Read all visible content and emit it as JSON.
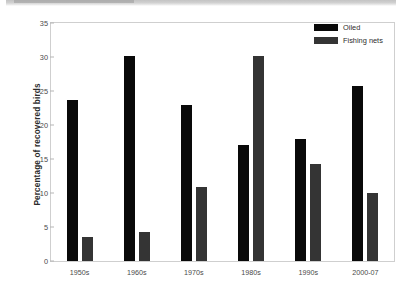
{
  "chart_data": {
    "type": "bar",
    "title": "",
    "xlabel": "",
    "ylabel": "Percentage of recovered birds",
    "categories": [
      "1950s",
      "1960s",
      "1970s",
      "1980s",
      "1990s",
      "2000-07"
    ],
    "series": [
      {
        "name": "Oiled",
        "color": "#090909",
        "values": [
          23.7,
          30.1,
          23.0,
          17.0,
          17.9,
          25.7
        ]
      },
      {
        "name": "Fishing nets",
        "color": "#343434",
        "values": [
          3.5,
          4.2,
          10.9,
          30.2,
          14.3,
          10.0
        ]
      }
    ],
    "ylim": [
      0,
      35
    ],
    "yticks": [
      0,
      5,
      10,
      15,
      20,
      25,
      30,
      35
    ],
    "ytick_labels": [
      "0",
      "5",
      "10",
      "15",
      "20",
      "25",
      "30",
      "35"
    ],
    "grid": false,
    "legend_position": "top-right"
  },
  "legend": {
    "entries": [
      {
        "label": "Oiled",
        "color": "#090909"
      },
      {
        "label": "Fishing nets",
        "color": "#343434"
      }
    ]
  },
  "axis": {
    "y_title": "Percentage of recovered birds"
  }
}
